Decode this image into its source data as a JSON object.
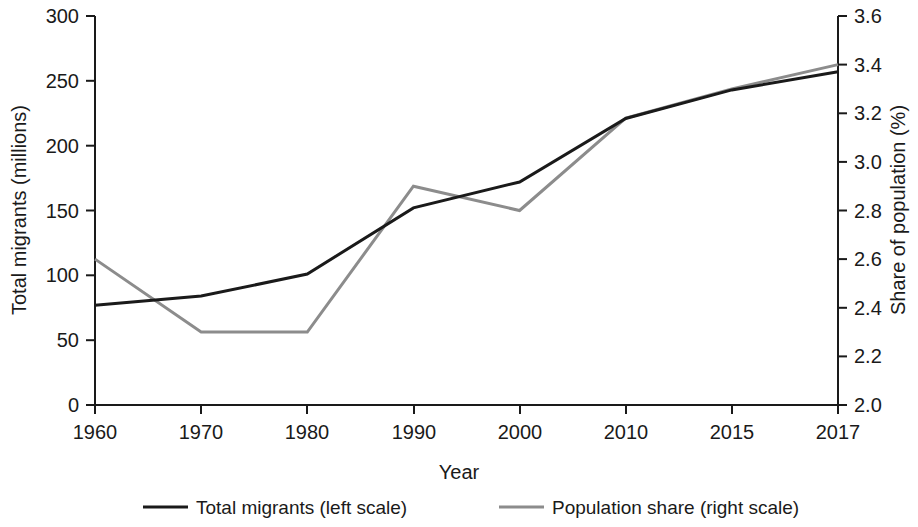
{
  "chart_data": {
    "type": "line",
    "title": "",
    "subtitle": "",
    "xlabel": "Year",
    "ylabel": "Total migrants (millions)",
    "y2label": "Share of population (%)",
    "categories": [
      "1960",
      "1970",
      "1980",
      "1990",
      "2000",
      "2010",
      "2015",
      "2017"
    ],
    "ylim": [
      0,
      300
    ],
    "yticks": [
      "0",
      "50",
      "100",
      "150",
      "200",
      "250",
      "300"
    ],
    "ytick_values": [
      0,
      50,
      100,
      150,
      200,
      250,
      300
    ],
    "y2lim": [
      2.0,
      3.6
    ],
    "y2ticks": [
      "2.0",
      "2.2",
      "2.4",
      "2.6",
      "2.8",
      "3.0",
      "3.2",
      "3.4",
      "3.6"
    ],
    "y2tick_values": [
      2.0,
      2.2,
      2.4,
      2.6,
      2.8,
      3.0,
      3.2,
      3.4,
      3.6
    ],
    "grid": false,
    "legend_position": "bottom",
    "series": [
      {
        "name": "Total migrants (left scale)",
        "axis": "left",
        "color": "#1a1a1a",
        "values": [
          77,
          84,
          101,
          152,
          172,
          221,
          243,
          257
        ]
      },
      {
        "name": "Population share (right scale)",
        "axis": "right",
        "color": "#8c8c8c",
        "values": [
          2.6,
          2.3,
          2.3,
          2.9,
          2.8,
          3.18,
          3.3,
          3.4
        ]
      }
    ]
  },
  "legend": {
    "items": [
      {
        "label": "Total migrants (left scale)",
        "color": "#1a1a1a"
      },
      {
        "label": "Population share (right scale)",
        "color": "#8c8c8c"
      }
    ]
  }
}
